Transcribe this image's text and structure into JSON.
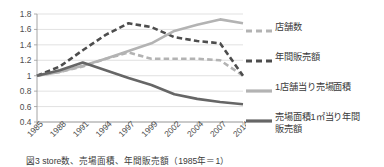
{
  "chart_data": {
    "type": "line",
    "title": "",
    "xlabel": "",
    "ylabel": "",
    "ylim": [
      0.4,
      1.8
    ],
    "ytick_step": 0.2,
    "grid": true,
    "legend_position": "right",
    "categories": [
      "1985",
      "1988",
      "1991",
      "1994",
      "1997",
      "1999",
      "2002",
      "2004",
      "2007",
      "2014"
    ],
    "yticks": [
      "1.8",
      "1.6",
      "1.4",
      "1.2",
      "1",
      "0.8",
      "0.6",
      "0.4"
    ],
    "series": [
      {
        "name": "店舗数",
        "style": "dashed",
        "color": "#b3b3b3",
        "values": [
          1.0,
          1.05,
          1.12,
          1.22,
          1.3,
          1.22,
          1.22,
          1.22,
          1.2,
          1.0
        ]
      },
      {
        "name": "年間販売額",
        "style": "dashed",
        "color": "#4d4d4d",
        "values": [
          1.0,
          1.12,
          1.33,
          1.53,
          1.68,
          1.63,
          1.5,
          1.45,
          1.42,
          1.0
        ]
      },
      {
        "name": "1店舗当り売場面積",
        "style": "solid",
        "color": "#b3b3b3",
        "values": [
          1.0,
          1.05,
          1.13,
          1.22,
          1.32,
          1.42,
          1.58,
          1.66,
          1.73,
          1.68
        ]
      },
      {
        "name": "売場面積1㎡当り年間販売額",
        "style": "solid",
        "color": "#666666",
        "values": [
          1.0,
          1.07,
          1.17,
          1.07,
          0.97,
          0.88,
          0.76,
          0.7,
          0.66,
          0.63
        ]
      }
    ]
  },
  "legend": {
    "items": [
      {
        "label": "店舗数",
        "style": "dashed",
        "color": "#b3b3b3"
      },
      {
        "label": "年間販売額",
        "style": "dashed",
        "color": "#4d4d4d"
      },
      {
        "label": "1店舗当り売場面積",
        "style": "solid",
        "color": "#b3b3b3"
      },
      {
        "label": "売場面積1㎡当り年間\n販売額",
        "style": "solid",
        "color": "#666666"
      }
    ]
  },
  "caption": {
    "text": "図3 store数、売場面積、年間販売額（1985年＝1）"
  }
}
